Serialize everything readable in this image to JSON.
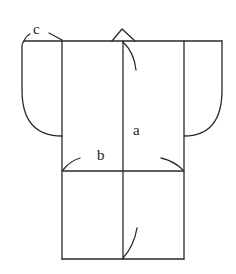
{
  "diagram": {
    "type": "garment-flat-pattern",
    "labels": {
      "a": "a",
      "b": "b",
      "c": "c"
    },
    "colors": {
      "line": "#2a2a2a",
      "background": "#ffffff",
      "text": "#222222"
    }
  }
}
